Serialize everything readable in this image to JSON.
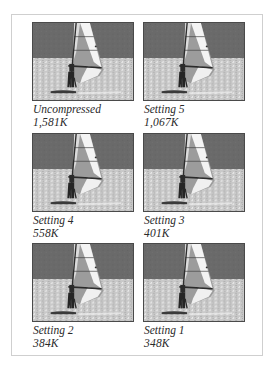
{
  "figure": {
    "panels": [
      {
        "label": "Uncompressed",
        "size": "1,581K"
      },
      {
        "label": "Setting 5",
        "size": "1,067K"
      },
      {
        "label": "Setting 4",
        "size": "558K"
      },
      {
        "label": "Setting 3",
        "size": "401K"
      },
      {
        "label": "Setting 2",
        "size": "384K"
      },
      {
        "label": "Setting 1",
        "size": "348K"
      }
    ],
    "image_subject": "windsurfer-photo",
    "colors": {
      "sky": "#6a6a6a",
      "water": "#c9c9c9",
      "sail_light": "#f2f2f2",
      "sail_dark": "#9a9a9a",
      "frame_border": "#cfcfcf"
    }
  }
}
